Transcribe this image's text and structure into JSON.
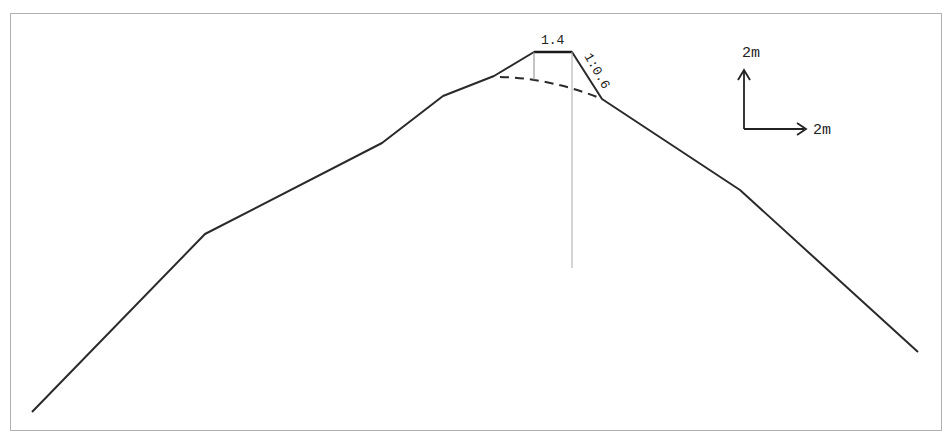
{
  "diagram": {
    "type": "cross-section profile",
    "top_width_label": "1.4",
    "slope_label": "1:0.6",
    "scale": {
      "vertical_label": "2m",
      "horizontal_label": "2m"
    },
    "colors": {
      "line": "#2a2a2a",
      "frame": "#b0b0b0",
      "guide": "#aaaaaa"
    }
  }
}
